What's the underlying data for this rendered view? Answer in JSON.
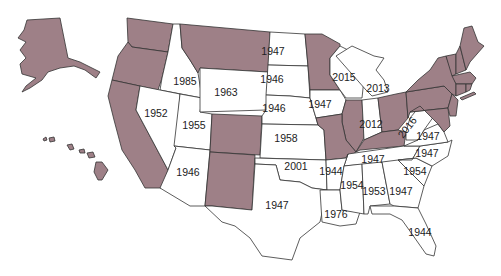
{
  "colors": {
    "shaded": "#9e8087",
    "unshaded": "#ffffff",
    "border": "#333333"
  },
  "legend_meaning": {
    "shaded": "state without year label",
    "unshaded": "state labeled with year"
  },
  "states": [
    {
      "id": "AK",
      "shaded": true,
      "label": ""
    },
    {
      "id": "HI",
      "shaded": true,
      "label": ""
    },
    {
      "id": "WA",
      "shaded": true,
      "label": ""
    },
    {
      "id": "OR",
      "shaded": true,
      "label": ""
    },
    {
      "id": "CA",
      "shaded": true,
      "label": ""
    },
    {
      "id": "ID",
      "shaded": false,
      "label": "1985"
    },
    {
      "id": "NV",
      "shaded": false,
      "label": "1952"
    },
    {
      "id": "UT",
      "shaded": false,
      "label": "1955"
    },
    {
      "id": "AZ",
      "shaded": false,
      "label": "1946"
    },
    {
      "id": "MT",
      "shaded": true,
      "label": ""
    },
    {
      "id": "WY",
      "shaded": false,
      "label": "1963"
    },
    {
      "id": "CO",
      "shaded": true,
      "label": ""
    },
    {
      "id": "NM",
      "shaded": true,
      "label": ""
    },
    {
      "id": "ND",
      "shaded": false,
      "label": "1947"
    },
    {
      "id": "SD",
      "shaded": false,
      "label": "1946"
    },
    {
      "id": "NE",
      "shaded": false,
      "label": "1946"
    },
    {
      "id": "KS",
      "shaded": false,
      "label": "1958"
    },
    {
      "id": "OK",
      "shaded": false,
      "label": "2001"
    },
    {
      "id": "TX",
      "shaded": false,
      "label": "1947"
    },
    {
      "id": "MN",
      "shaded": true,
      "label": ""
    },
    {
      "id": "IA",
      "shaded": false,
      "label": "1947"
    },
    {
      "id": "MO",
      "shaded": true,
      "label": ""
    },
    {
      "id": "AR",
      "shaded": false,
      "label": "1944"
    },
    {
      "id": "LA",
      "shaded": false,
      "label": "1976"
    },
    {
      "id": "WI",
      "shaded": false,
      "label": "2015"
    },
    {
      "id": "IL",
      "shaded": true,
      "label": ""
    },
    {
      "id": "MI",
      "shaded": false,
      "label": "2013"
    },
    {
      "id": "IN",
      "shaded": false,
      "label": "2012"
    },
    {
      "id": "OH",
      "shaded": true,
      "label": ""
    },
    {
      "id": "KY",
      "shaded": true,
      "label": ""
    },
    {
      "id": "TN",
      "shaded": false,
      "label": "1947"
    },
    {
      "id": "MS",
      "shaded": false,
      "label": "1954"
    },
    {
      "id": "AL",
      "shaded": false,
      "label": "1953"
    },
    {
      "id": "GA",
      "shaded": false,
      "label": "1947"
    },
    {
      "id": "FL",
      "shaded": false,
      "label": "1944"
    },
    {
      "id": "SC",
      "shaded": false,
      "label": "1954"
    },
    {
      "id": "NC",
      "shaded": false,
      "label": "1947"
    },
    {
      "id": "VA",
      "shaded": false,
      "label": "1947"
    },
    {
      "id": "WV",
      "shaded": false,
      "label": "2016"
    },
    {
      "id": "PA",
      "shaded": true,
      "label": ""
    },
    {
      "id": "NY",
      "shaded": true,
      "label": ""
    },
    {
      "id": "MD",
      "shaded": true,
      "label": ""
    },
    {
      "id": "DE",
      "shaded": true,
      "label": ""
    },
    {
      "id": "NJ",
      "shaded": true,
      "label": ""
    },
    {
      "id": "CT",
      "shaded": true,
      "label": ""
    },
    {
      "id": "RI",
      "shaded": true,
      "label": ""
    },
    {
      "id": "MA",
      "shaded": true,
      "label": ""
    },
    {
      "id": "VT",
      "shaded": true,
      "label": ""
    },
    {
      "id": "NH",
      "shaded": true,
      "label": ""
    },
    {
      "id": "ME",
      "shaded": true,
      "label": ""
    }
  ],
  "labels": {
    "ID": "1985",
    "NV": "1952",
    "UT": "1955",
    "AZ": "1946",
    "WY": "1963",
    "ND": "1947",
    "SD": "1946",
    "NE": "1946",
    "KS": "1958",
    "OK": "2001",
    "TX": "1947",
    "IA": "1947",
    "AR": "1944",
    "LA": "1976",
    "WI": "2015",
    "MI": "2013",
    "IN": "2012",
    "TN": "1947",
    "MS": "1954",
    "AL": "1953",
    "GA": "1947",
    "FL": "1944",
    "SC": "1954",
    "NC": "1947",
    "VA": "1947",
    "WV": "2016"
  }
}
